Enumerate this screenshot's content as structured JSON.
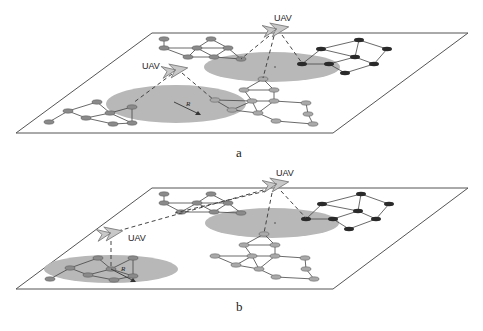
{
  "figure": {
    "panels": [
      {
        "id": "a",
        "caption": "a",
        "uavs": [
          {
            "label": "UAV",
            "x": 178,
            "y": 69,
            "label_x": 142,
            "label_y": 67
          },
          {
            "label": "UAV",
            "x": 275,
            "y": 30,
            "label_x": 274,
            "label_y": 18
          }
        ],
        "coverage_areas": [
          {
            "cx": 176,
            "cy": 104,
            "rx": 70,
            "ry": 19
          },
          {
            "cx": 272,
            "cy": 67,
            "rx": 68,
            "ry": 15
          }
        ],
        "radius_label": "R"
      },
      {
        "id": "b",
        "caption": "b",
        "uavs": [
          {
            "label": "UAV",
            "x": 110,
            "y": 234,
            "label_x": 128,
            "label_y": 241
          },
          {
            "label": "UAV",
            "x": 275,
            "y": 186,
            "label_x": 276,
            "label_y": 174
          }
        ],
        "coverage_areas": [
          {
            "cx": 111,
            "cy": 269,
            "rx": 67,
            "ry": 14
          },
          {
            "cx": 272,
            "cy": 223,
            "rx": 67,
            "ry": 15
          }
        ],
        "radius_label": "R"
      }
    ],
    "colors": {
      "plane_border": "#555555",
      "coverage": "#b8b8b8",
      "node_gray": "#8a8a8a",
      "node_light": "#a9a9a9",
      "node_dark": "#2a2a2a",
      "edge": "#444444",
      "uav_fill": "#c8c8c8"
    }
  }
}
